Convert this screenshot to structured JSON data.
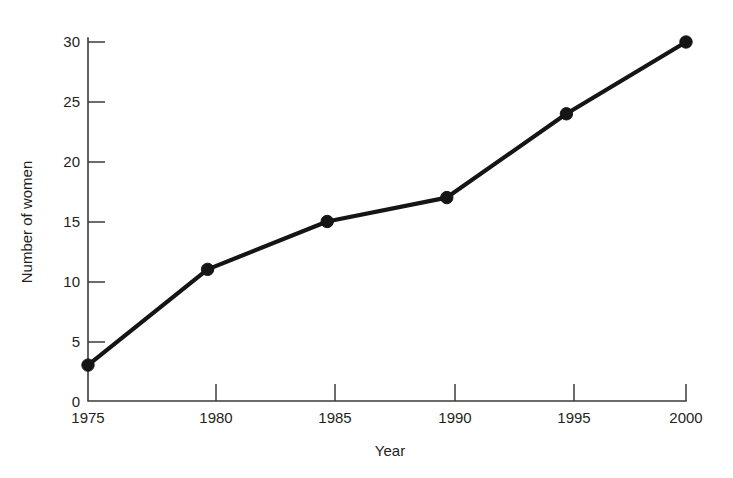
{
  "chart_data": {
    "type": "line",
    "title": "",
    "subtitle": "",
    "xlabel": "Year",
    "ylabel": "Number of women",
    "x": [
      1975,
      1980,
      1985,
      1990,
      1995,
      2000
    ],
    "values": [
      3,
      11,
      15,
      17,
      24,
      30
    ],
    "series": [
      {
        "name": "Number of women",
        "values": [
          3,
          11,
          15,
          17,
          24,
          30
        ]
      }
    ],
    "x_tick_labels": [
      "1975",
      "1980",
      "1985",
      "1990",
      "1995",
      "2000"
    ],
    "y_tick_labels": [
      "0",
      "5",
      "10",
      "15",
      "20",
      "25",
      "30"
    ],
    "y_ticks": [
      0,
      5,
      10,
      15,
      20,
      25,
      30
    ],
    "xlim": [
      1975,
      2000
    ],
    "ylim": [
      0,
      30
    ],
    "grid": false,
    "legend": false,
    "legend_position": "none",
    "marker": "filled-circle",
    "line_color": "#151515",
    "marker_color": "#151515",
    "axis_color": "#3b3b3b",
    "text_color": "#231f20",
    "background_color": "#ffffff"
  }
}
